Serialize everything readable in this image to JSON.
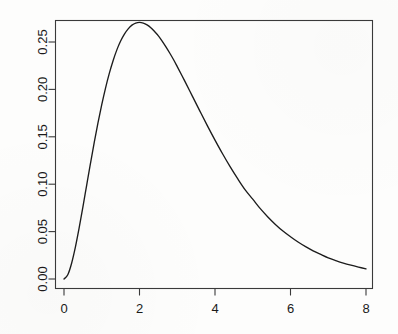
{
  "chart_data": {
    "type": "line",
    "title": "",
    "subtitle": "",
    "xlabel": "",
    "ylabel": "",
    "xlim": [
      0,
      8
    ],
    "ylim": [
      0,
      0.28
    ],
    "grid": false,
    "legend": null,
    "annotations": [],
    "x_ticks": [
      {
        "value": 0,
        "label": "0"
      },
      {
        "value": 2,
        "label": "2"
      },
      {
        "value": 4,
        "label": "4"
      },
      {
        "value": 6,
        "label": "6"
      },
      {
        "value": 8,
        "label": "8"
      }
    ],
    "y_ticks": [
      {
        "value": 0.0,
        "label": "0.00"
      },
      {
        "value": 0.05,
        "label": "0.05"
      },
      {
        "value": 0.1,
        "label": "0.10"
      },
      {
        "value": 0.15,
        "label": "0.15"
      },
      {
        "value": 0.2,
        "label": "0.20"
      },
      {
        "value": 0.25,
        "label": "0.25"
      }
    ],
    "y_tick_orientation": "rotated-90",
    "series": [
      {
        "name": "density",
        "color": "#1c1c1c",
        "x": [
          0,
          0.1,
          0.2,
          0.3,
          0.4,
          0.5,
          0.6,
          0.7,
          0.8,
          0.9,
          1.0,
          1.1,
          1.2,
          1.3,
          1.4,
          1.5,
          1.6,
          1.7,
          1.8,
          1.9,
          2.0,
          2.1,
          2.2,
          2.3,
          2.4,
          2.5,
          2.6,
          2.7,
          2.8,
          2.9,
          3.0,
          3.2,
          3.4,
          3.6,
          3.8,
          4.0,
          4.2,
          4.4,
          4.6,
          4.8,
          5.0,
          5.2,
          5.4,
          5.6,
          5.8,
          6.0,
          6.2,
          6.4,
          6.6,
          6.8,
          7.0,
          7.2,
          7.4,
          7.6,
          7.8,
          8.0
        ],
        "values": [
          0.0,
          0.0045,
          0.0164,
          0.0333,
          0.0536,
          0.0758,
          0.0988,
          0.1216,
          0.1438,
          0.1647,
          0.1839,
          0.2014,
          0.2169,
          0.2303,
          0.2417,
          0.251,
          0.2584,
          0.2639,
          0.2678,
          0.27,
          0.2707,
          0.27,
          0.2681,
          0.2651,
          0.261,
          0.2565,
          0.251,
          0.2449,
          0.2384,
          0.2315,
          0.224,
          0.2087,
          0.1929,
          0.1771,
          0.1615,
          0.1465,
          0.1321,
          0.1185,
          0.1058,
          0.094,
          0.0842,
          0.0742,
          0.0655,
          0.0576,
          0.0506,
          0.0446,
          0.039,
          0.0341,
          0.0297,
          0.0259,
          0.0223,
          0.0194,
          0.0168,
          0.0146,
          0.0126,
          0.0107
        ]
      }
    ]
  },
  "figure": {
    "background_color": "#fdfdfc",
    "axis_color": "#3a3a3a",
    "curve_color": "#1c1c1c"
  }
}
